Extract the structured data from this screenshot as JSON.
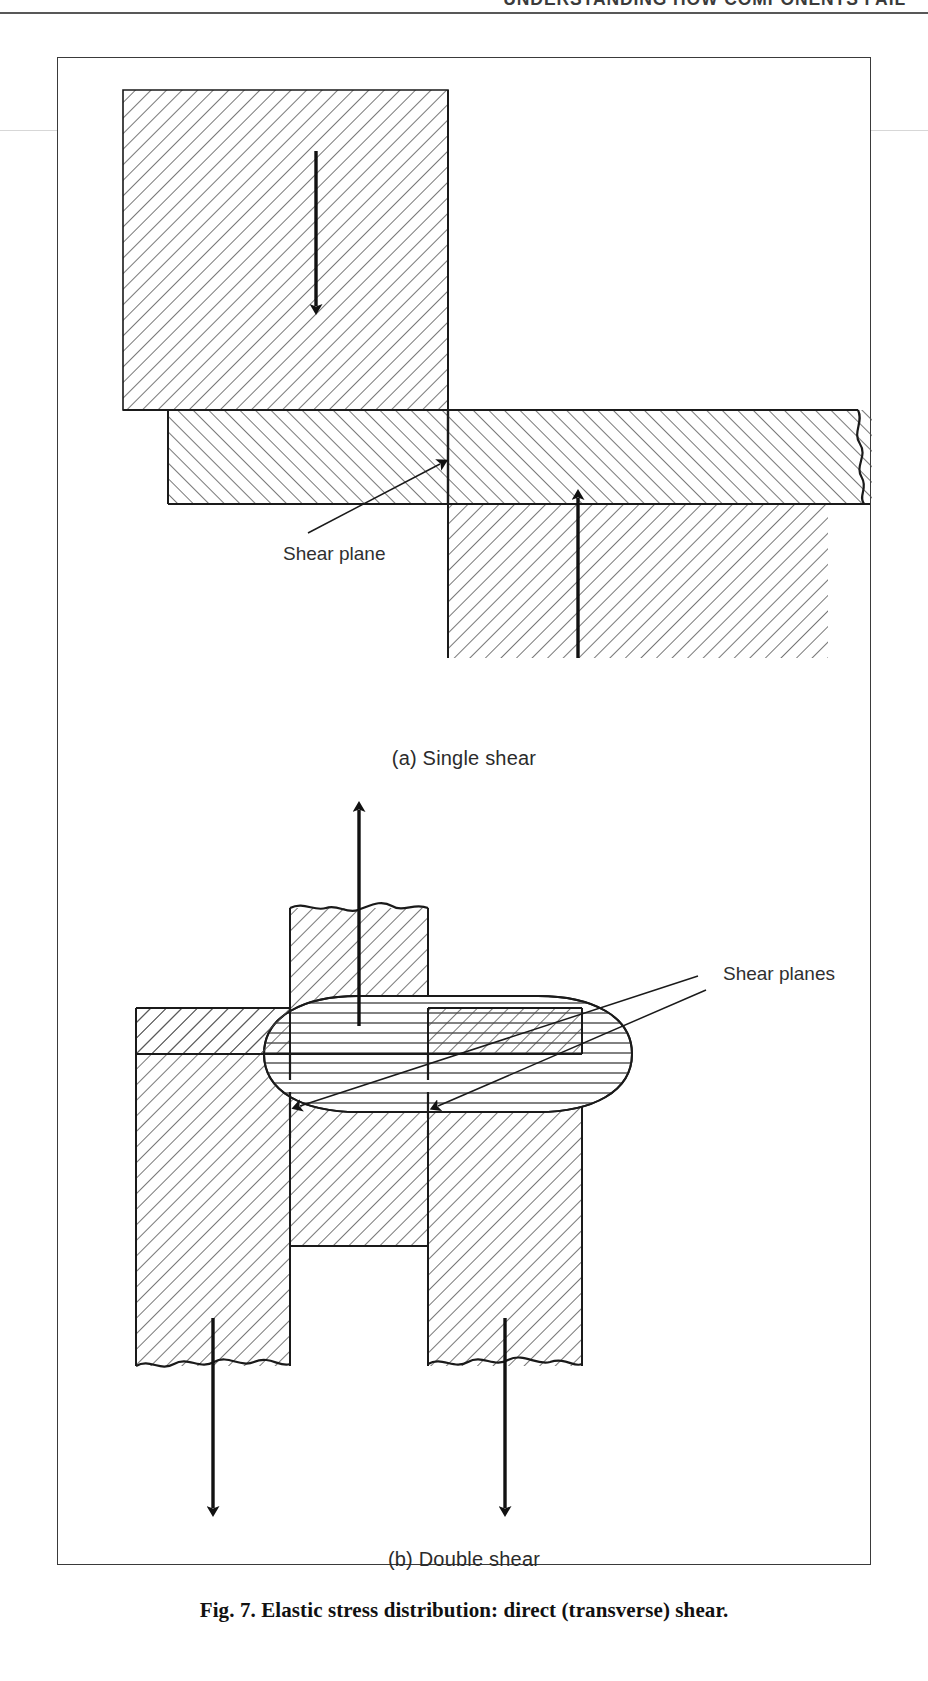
{
  "page": {
    "running_head": "UNDERSTANDING HOW COMPONENTS FAIL",
    "width": 928,
    "height": 1681,
    "background": "#ffffff",
    "ink": "#1a1a1a"
  },
  "figure": {
    "caption": "Fig. 7. Elastic stress distribution: direct (transverse) shear.",
    "border_color": "#3a3a3a",
    "panels": [
      {
        "id": "a",
        "caption": "(a)  Single shear",
        "annotation": "Shear plane",
        "description": "Lap joint of two hatched members overlapping; the upper member is loaded downward and the lower member upward, producing one shear plane at the interface.",
        "arrows": [
          {
            "name": "load-arrow-down",
            "direction": "down"
          },
          {
            "name": "load-arrow-up",
            "direction": "up"
          }
        ],
        "shear_plane_count": 1
      },
      {
        "id": "b",
        "caption": "(b)  Double shear",
        "annotation": "Shear planes",
        "description": "Clevis / tongue joint with a pin. The central tongue is pulled upward while the two outer clevis legs are pulled downward, producing two shear planes through the pin.",
        "arrows": [
          {
            "name": "load-arrow-up",
            "direction": "up"
          },
          {
            "name": "load-arrow-down-left",
            "direction": "down"
          },
          {
            "name": "load-arrow-down-right",
            "direction": "down"
          }
        ],
        "shear_plane_count": 2
      }
    ]
  },
  "styles": {
    "hatch_angle_deg": 45,
    "hatch_color": "#4a4a4a",
    "pin_hatch": "horizontal",
    "line_color": "#1a1a1a"
  }
}
